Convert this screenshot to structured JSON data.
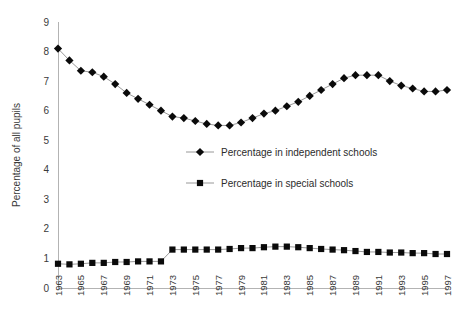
{
  "chart_data": {
    "type": "line",
    "title": "",
    "xlabel": "",
    "ylabel": "Percentage of all pupils",
    "ylim": [
      0,
      9
    ],
    "ytick_step": 1,
    "yticks": [
      "0",
      "1",
      "2",
      "3",
      "4",
      "5",
      "6",
      "7",
      "8",
      "9"
    ],
    "grid": false,
    "legend_position": "center",
    "x": [
      1963,
      1964,
      1965,
      1966,
      1967,
      1968,
      1969,
      1970,
      1971,
      1972,
      1973,
      1974,
      1975,
      1976,
      1977,
      1978,
      1979,
      1980,
      1981,
      1982,
      1983,
      1984,
      1985,
      1986,
      1987,
      1988,
      1989,
      1990,
      1991,
      1992,
      1993,
      1994,
      1995,
      1996,
      1997
    ],
    "xtick_labels": [
      "1963",
      "1965",
      "1967",
      "1969",
      "1971",
      "1973",
      "1975",
      "1977",
      "1979",
      "1981",
      "1983",
      "1985",
      "1987",
      "1989",
      "1991",
      "1993",
      "1995",
      "1997"
    ],
    "xtick_values": [
      1963,
      1965,
      1967,
      1969,
      1971,
      1973,
      1975,
      1977,
      1979,
      1981,
      1983,
      1985,
      1987,
      1989,
      1991,
      1993,
      1995,
      1997
    ],
    "series": [
      {
        "name": "Percentage in independent schools",
        "marker": "diamond",
        "color": "#0a0a0a",
        "values": [
          8.1,
          7.7,
          7.35,
          7.3,
          7.15,
          6.9,
          6.6,
          6.4,
          6.2,
          6.0,
          5.8,
          5.75,
          5.65,
          5.55,
          5.5,
          5.5,
          5.6,
          5.75,
          5.9,
          6.0,
          6.15,
          6.3,
          6.5,
          6.7,
          6.9,
          7.1,
          7.2,
          7.2,
          7.2,
          7.0,
          6.85,
          6.75,
          6.65,
          6.65,
          6.7
        ]
      },
      {
        "name": "Percentage in special schools",
        "marker": "square",
        "color": "#0a0a0a",
        "values": [
          0.82,
          0.8,
          0.82,
          0.85,
          0.85,
          0.88,
          0.88,
          0.9,
          0.9,
          0.9,
          1.3,
          1.3,
          1.3,
          1.3,
          1.3,
          1.32,
          1.35,
          1.35,
          1.38,
          1.4,
          1.4,
          1.38,
          1.35,
          1.32,
          1.3,
          1.28,
          1.25,
          1.22,
          1.22,
          1.2,
          1.2,
          1.18,
          1.18,
          1.15,
          1.15
        ]
      }
    ],
    "legend": [
      {
        "label": "Percentage in independent schools",
        "marker": "diamond"
      },
      {
        "label": "Percentage in special schools",
        "marker": "square"
      }
    ]
  }
}
